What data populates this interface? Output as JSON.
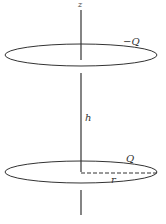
{
  "diagram": {
    "title": "",
    "labels": {
      "axis": "z",
      "top_ring_charge": "−Q",
      "separation": "h",
      "bottom_ring_charge": "Q",
      "radius": "r"
    },
    "colors": {
      "stroke": "#333333",
      "background": "#ffffff"
    }
  }
}
